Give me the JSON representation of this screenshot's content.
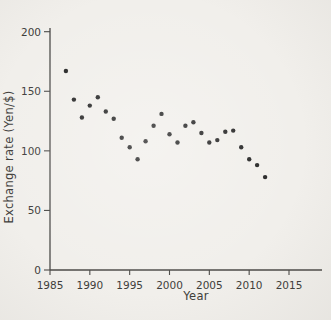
{
  "figure": {
    "background_color": "#f1efeb",
    "axis_color": "#4b4a47",
    "tick_text_color": "#3e3d3a",
    "dot_color": "#232323"
  },
  "chart_data": {
    "type": "scatter",
    "title": "",
    "xlabel": "Year",
    "ylabel": "Exchange rate (Yen/$)",
    "x_ticks": [
      1985,
      1990,
      1995,
      2000,
      2005,
      2010,
      2015
    ],
    "y_ticks": [
      0,
      50,
      100,
      150,
      200
    ],
    "xlim": [
      1985,
      2019
    ],
    "ylim": [
      0,
      203
    ],
    "grid": false,
    "legend": false,
    "marker": "filled_circle",
    "x": [
      1987,
      1988,
      1989,
      1990,
      1991,
      1992,
      1993,
      1994,
      1995,
      1996,
      1997,
      1998,
      1999,
      2000,
      2001,
      2002,
      2003,
      2004,
      2005,
      2006,
      2007,
      2008,
      2009,
      2010,
      2011,
      2012
    ],
    "y": [
      167,
      143,
      128,
      138,
      145,
      133,
      127,
      111,
      103,
      93,
      108,
      121,
      131,
      114,
      107,
      121,
      124,
      115,
      107,
      109,
      116,
      117,
      103,
      93,
      88,
      78
    ]
  }
}
